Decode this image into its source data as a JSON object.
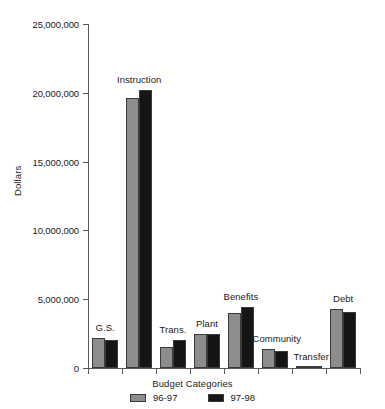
{
  "chart_data": {
    "type": "bar",
    "title": "",
    "xlabel": "Budget Categories",
    "ylabel": "Dollars",
    "categories": [
      "G.S.",
      "Instruction",
      "Trans.",
      "Plant",
      "Benefits",
      "Community",
      "Transfer",
      "Debt"
    ],
    "series": [
      {
        "name": "96-97",
        "color": "#8d8d8d",
        "values": [
          2200000,
          19600000,
          1550000,
          2450000,
          4000000,
          1350000,
          50000,
          4300000
        ]
      },
      {
        "name": "97-98",
        "color": "#151515",
        "values": [
          2050000,
          20200000,
          2000000,
          2450000,
          4450000,
          1270000,
          50000,
          4100000
        ]
      }
    ],
    "ylim": [
      0,
      25000000
    ],
    "ytick_values": [
      0,
      5000000,
      10000000,
      15000000,
      20000000,
      25000000
    ],
    "ytick_labels": [
      "0",
      "5,000,000",
      "10,000,000",
      "15,000,000",
      "20,000,000",
      "25,000,000"
    ],
    "grid": false,
    "legend_position": "bottom",
    "legend_entries": [
      "96-97",
      "97-98"
    ]
  }
}
